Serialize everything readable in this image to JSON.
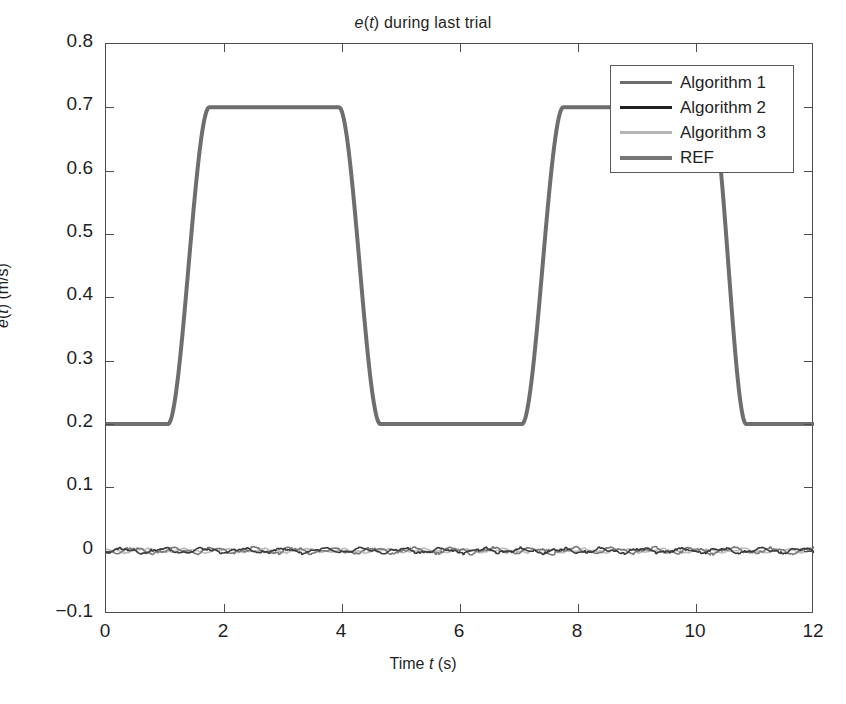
{
  "chart_data": {
    "type": "line",
    "title": "e(t) during last trial",
    "title_parts": {
      "pre": "",
      "var1": "e",
      "mid": "(",
      "var2": "t",
      "post": ") during last trial"
    },
    "xlabel": "Time t (s)",
    "ylabel": "e(t) (m/s)",
    "xlim": [
      0,
      12
    ],
    "ylim": [
      -0.1,
      0.8
    ],
    "xticks": [
      "0",
      "2",
      "4",
      "6",
      "8",
      "10",
      "12"
    ],
    "xtick_values": [
      0,
      2,
      4,
      6,
      8,
      10,
      12
    ],
    "yticks": [
      "0.8",
      "0.7",
      "0.6",
      "0.5",
      "0.4",
      "0.3",
      "0.2",
      "0.1",
      "0",
      "-0.1"
    ],
    "ytick_values": [
      0.8,
      0.7,
      0.6,
      0.5,
      0.4,
      0.3,
      0.2,
      0.1,
      0,
      -0.1
    ],
    "grid": false,
    "legend_position": "upper right",
    "legend": [
      {
        "label": "Algorithm 1",
        "color": "#6b6b6b",
        "width": 3.2
      },
      {
        "label": "Algorithm 2",
        "color": "#202020",
        "width": 3.6
      },
      {
        "label": "Algorithm 3",
        "color": "#b5b5b5",
        "width": 3.2
      },
      {
        "label": "REF",
        "color": "#767676",
        "width": 4.0
      }
    ],
    "series": [
      {
        "name": "REF",
        "color": "#6e6e6e",
        "width": 4.0,
        "description": "Smooth trapezoidal reference: baseline 0.2 m/s, two plateaus at 0.7 m/s",
        "baseline": 0.2,
        "plateau": 0.7,
        "pulses": [
          {
            "rise_start": 1.05,
            "rise_end": 1.75,
            "fall_start": 3.95,
            "fall_end": 4.65
          },
          {
            "rise_start": 7.05,
            "rise_end": 7.75,
            "fall_start": 10.25,
            "fall_end": 10.85
          }
        ]
      },
      {
        "name": "Algorithm 1",
        "color": "#7a7a7a",
        "width": 1.6,
        "description": "Tracking error, oscillates about 0 m/s",
        "mean": 0.0,
        "noise_amplitude": 0.006
      },
      {
        "name": "Algorithm 2",
        "color": "#3a3a3a",
        "width": 1.6,
        "description": "Tracking error, oscillates about 0 m/s",
        "mean": 0.0,
        "noise_amplitude": 0.005
      },
      {
        "name": "Algorithm 3",
        "color": "#bdbdbd",
        "width": 1.6,
        "description": "Tracking error, oscillates about 0 m/s",
        "mean": 0.0,
        "noise_amplitude": 0.004
      }
    ]
  },
  "style": {
    "axis_color": "#4d4d4d",
    "text_color": "#1f1f1f",
    "background": "#ffffff",
    "legend_border": "#5a5a5a"
  }
}
